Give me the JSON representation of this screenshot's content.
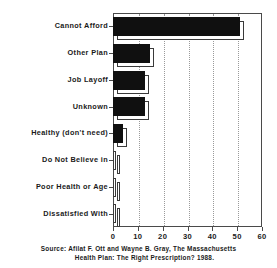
{
  "chart_data": {
    "type": "bar",
    "orientation": "horizontal",
    "title": "",
    "xlabel": "",
    "ylabel": "",
    "xlim": [
      0,
      60
    ],
    "xticks": [
      0,
      10,
      20,
      30,
      40,
      50,
      60
    ],
    "grid": "vertical-dotted",
    "legend": "none",
    "categories": [
      "Cannot Afford",
      "Other Plan",
      "Job Layoff",
      "Unknown",
      "Healthy (don't need)",
      "Do Not Believe in",
      "Poor Health or Age",
      "Dissatisfied With"
    ],
    "values": [
      51,
      15,
      13,
      13,
      4,
      1,
      0.8,
      0.8
    ],
    "bar_style": "3d-block",
    "bar_fill": "#101010",
    "bar_outline": "#3a3a3a"
  },
  "source": {
    "line1": "Source:  Afilat F. Ott and Wayne B. Gray, The Massachusetts",
    "line2": "Health Plan:  The Right Prescription?  1988."
  }
}
